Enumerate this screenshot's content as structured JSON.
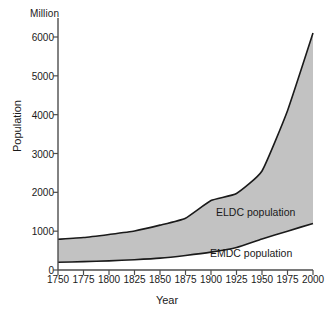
{
  "chart_data": {
    "type": "area",
    "title": "",
    "subtitle": "",
    "xlabel": "Year",
    "ylabel": "Population",
    "unit_label": "Million",
    "xlim": [
      1750,
      2000
    ],
    "ylim": [
      0,
      6000
    ],
    "grid": false,
    "legend_position": "inside-plot-annotations",
    "stacked": true,
    "x": [
      1750,
      1775,
      1800,
      1825,
      1850,
      1875,
      1900,
      1925,
      1950,
      1975,
      2000
    ],
    "xticklabels": [
      "1750",
      "1775",
      "1800",
      "1825",
      "1850",
      "1875",
      "1900",
      "1925",
      "1950",
      "1975",
      "2000"
    ],
    "yticks": [
      0,
      1000,
      2000,
      3000,
      4000,
      5000,
      6000
    ],
    "yticklabels": [
      "0",
      "1000",
      "2000",
      "3000",
      "4000",
      "5000",
      "6000"
    ],
    "series": [
      {
        "name": "EMDC population",
        "fill": "#ffffff",
        "values": [
          200,
          215,
          235,
          265,
          305,
          375,
          460,
          580,
          800,
          1000,
          1200
        ]
      },
      {
        "name": "ELDC population",
        "fill": "#c2c2c2",
        "values": [
          590,
          620,
          680,
          740,
          850,
          960,
          1330,
          1390,
          1750,
          3100,
          4900
        ]
      }
    ],
    "cumulative_total": [
      790,
      835,
      915,
      1005,
      1155,
      1335,
      1790,
      1970,
      2550,
      4100,
      6100
    ],
    "annotations": [
      {
        "text": "ELDC population",
        "x": 1910,
        "y": 1450
      },
      {
        "text": "EMDC population",
        "x": 1900,
        "y": 500
      }
    ]
  },
  "axes": {
    "x_title": "Year",
    "y_title": "Population",
    "unit": "Million"
  },
  "style": {
    "line_color": "#1a1a1a",
    "band_fill": "#c2c2c2",
    "axis_color": "#4d4d4d",
    "background": "#ffffff"
  }
}
